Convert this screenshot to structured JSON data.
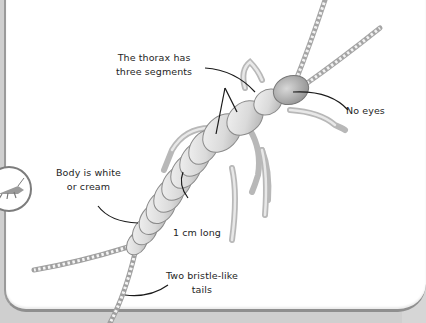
{
  "diagram": {
    "labels": {
      "thorax_line1": "The thorax has",
      "thorax_line2": "three segments",
      "eyes": "No eyes",
      "body_line1": "Body is white",
      "body_line2": "or cream",
      "length": "1 cm long",
      "tails_line1": "Two bristle-like",
      "tails_line2": "tails"
    },
    "icons": {
      "badge": "insect-badge-icon"
    },
    "colors": {
      "background": "#ffffff",
      "frame": "#cfcfcf",
      "border": "#8f8f8f",
      "text": "#1e1e1e",
      "insect_light": "#e6e6e6",
      "insect_shade": "#a8a8a8",
      "leader_line": "#1a1a1a"
    }
  }
}
